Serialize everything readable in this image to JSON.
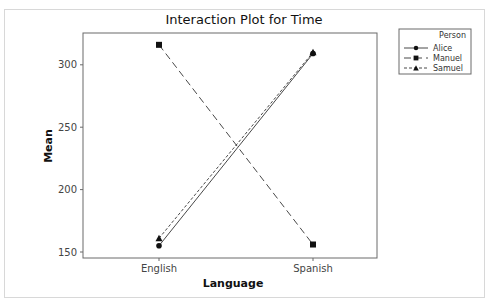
{
  "chart_data": {
    "type": "line",
    "title": "Interaction Plot for Time",
    "xlabel": "Language",
    "ylabel": "Mean",
    "categories": [
      "English",
      "Spanish"
    ],
    "yticks": [
      150,
      200,
      250,
      300
    ],
    "ylim": [
      145,
      326
    ],
    "grid": false,
    "legend_position": "right",
    "legend_title": "Person",
    "series": [
      {
        "name": "Alice",
        "values": [
          155,
          309
        ],
        "marker": "circle",
        "line": "solid"
      },
      {
        "name": "Manuel",
        "values": [
          316,
          156
        ],
        "marker": "square",
        "line": "long-dash"
      },
      {
        "name": "Samuel",
        "values": [
          161,
          310
        ],
        "marker": "triangle",
        "line": "short-dash"
      }
    ]
  }
}
